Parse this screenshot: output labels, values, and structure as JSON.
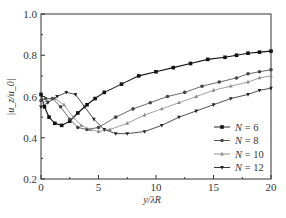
{
  "chart_data": {
    "type": "line",
    "title": "",
    "xlabel": "y/λR",
    "ylabel": "|u_z/u_0|",
    "xlim": [
      0,
      20
    ],
    "ylim": [
      0.2,
      1.0
    ],
    "xticks": [
      0,
      5,
      10,
      15,
      20
    ],
    "yticks": [
      0.2,
      0.4,
      0.6,
      0.8,
      1.0
    ],
    "xtick_labels": [
      "0",
      "5",
      "10",
      "15",
      "20"
    ],
    "ytick_labels": [
      "0.2",
      "0.4",
      "0.6",
      "0.8",
      "1.0"
    ],
    "grid": false,
    "legend_position": "lower-right",
    "series": [
      {
        "name": "N = 6",
        "marker": "square",
        "color": "#111111",
        "x": [
          0,
          0.3,
          0.7,
          1.2,
          1.8,
          2.5,
          3.2,
          4.0,
          4.7,
          5.5,
          7.0,
          8.5,
          10.0,
          11.5,
          13.0,
          14.5,
          16.0,
          17.0,
          18.0,
          19.0,
          20.0
        ],
        "y": [
          0.61,
          0.55,
          0.5,
          0.47,
          0.46,
          0.48,
          0.52,
          0.56,
          0.59,
          0.62,
          0.66,
          0.7,
          0.72,
          0.74,
          0.76,
          0.78,
          0.79,
          0.8,
          0.81,
          0.815,
          0.82
        ]
      },
      {
        "name": "N = 8",
        "marker": "circle",
        "color": "#444444",
        "x": [
          0,
          0.4,
          1.0,
          1.7,
          2.5,
          3.2,
          4.0,
          5.0,
          6.5,
          8.0,
          9.5,
          11.0,
          12.5,
          14.0,
          15.5,
          17.0,
          18.0,
          19.0,
          20.0
        ],
        "y": [
          0.58,
          0.59,
          0.59,
          0.55,
          0.49,
          0.45,
          0.44,
          0.45,
          0.5,
          0.54,
          0.57,
          0.6,
          0.62,
          0.65,
          0.67,
          0.69,
          0.71,
          0.72,
          0.73
        ]
      },
      {
        "name": "N = 10",
        "marker": "triangle-up",
        "color": "#888888",
        "x": [
          0,
          0.5,
          1.2,
          2.0,
          2.8,
          3.5,
          4.3,
          5.0,
          6.0,
          7.5,
          9.0,
          10.5,
          12.0,
          13.5,
          15.0,
          16.5,
          18.0,
          19.0,
          20.0
        ],
        "y": [
          0.56,
          0.58,
          0.59,
          0.56,
          0.5,
          0.46,
          0.44,
          0.43,
          0.44,
          0.47,
          0.51,
          0.54,
          0.57,
          0.6,
          0.63,
          0.65,
          0.67,
          0.69,
          0.7
        ]
      },
      {
        "name": "N = 12",
        "marker": "triangle-down",
        "color": "#222222",
        "x": [
          0,
          0.6,
          1.4,
          2.2,
          3.0,
          3.8,
          4.6,
          5.5,
          6.5,
          7.5,
          9.0,
          10.5,
          12.0,
          13.5,
          15.0,
          16.5,
          18.0,
          19.0,
          20.0
        ],
        "y": [
          0.55,
          0.57,
          0.6,
          0.62,
          0.61,
          0.55,
          0.49,
          0.44,
          0.42,
          0.42,
          0.43,
          0.46,
          0.5,
          0.53,
          0.56,
          0.59,
          0.61,
          0.63,
          0.64
        ]
      }
    ]
  }
}
